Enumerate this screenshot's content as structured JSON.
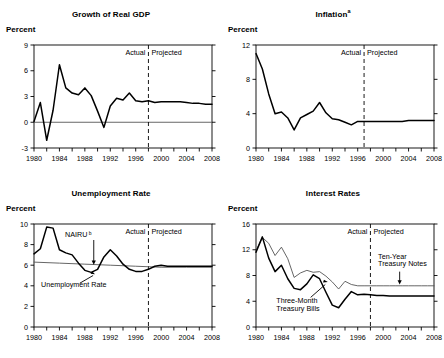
{
  "figure": {
    "panel_title_suffix_note_a": "a",
    "panel_title_suffix_note_b": "b",
    "axis_unit_label": "Percent",
    "actual_label": "Actual",
    "projected_label": "Projected"
  },
  "chart_data": [
    {
      "id": "growth-of-real-gdp",
      "type": "line",
      "title": "Growth of Real GDP",
      "title_superscript": "",
      "ylabel": "Percent",
      "xlabel": "",
      "ylim": [
        -3,
        9
      ],
      "yticks": [
        -3,
        0,
        3,
        6,
        9
      ],
      "ytick_labels": [
        "-3",
        "0",
        "3",
        "6",
        "9"
      ],
      "xlim": [
        1980,
        2008
      ],
      "xticks": [
        1980,
        1982,
        1984,
        1986,
        1988,
        1990,
        1992,
        1994,
        1996,
        1998,
        2000,
        2002,
        2004,
        2006,
        2008
      ],
      "xtick_labels": [
        "1980",
        "",
        "1984",
        "",
        "1988",
        "",
        "1992",
        "",
        "1996",
        "",
        "2000",
        "",
        "2004",
        "",
        "2008"
      ],
      "zero_line": 0,
      "divider_x": 1998,
      "divider_labels": {
        "left": "Actual",
        "right": "Projected"
      },
      "grid": false,
      "legend": "none",
      "series": [
        {
          "name": "Growth of Real GDP",
          "style": "thick",
          "x": [
            1980,
            1981,
            1982,
            1983,
            1984,
            1985,
            1986,
            1987,
            1988,
            1989,
            1990,
            1991,
            1992,
            1993,
            1994,
            1995,
            1996,
            1997,
            1998,
            1999,
            2000,
            2001,
            2002,
            2003,
            2004,
            2005,
            2006,
            2007,
            2008
          ],
          "values": [
            0.1,
            2.3,
            -2.1,
            1.4,
            6.7,
            4.0,
            3.4,
            3.2,
            4.0,
            3.1,
            1.3,
            -0.6,
            1.9,
            2.8,
            2.6,
            3.4,
            2.5,
            2.4,
            2.5,
            2.3,
            2.4,
            2.4,
            2.4,
            2.4,
            2.3,
            2.2,
            2.2,
            2.1,
            2.1
          ]
        }
      ],
      "annotations": []
    },
    {
      "id": "inflation",
      "type": "line",
      "title": "Inflation",
      "title_superscript": "a",
      "ylabel": "Percent",
      "xlabel": "",
      "ylim": [
        0,
        12
      ],
      "yticks": [
        0,
        4,
        8,
        12
      ],
      "ytick_labels": [
        "0",
        "4",
        "8",
        "12"
      ],
      "xlim": [
        1980,
        2008
      ],
      "xticks": [
        1980,
        1982,
        1984,
        1986,
        1988,
        1990,
        1992,
        1994,
        1996,
        1998,
        2000,
        2002,
        2004,
        2006,
        2008
      ],
      "xtick_labels": [
        "1980",
        "",
        "1984",
        "",
        "1988",
        "",
        "1992",
        "",
        "1996",
        "",
        "2000",
        "",
        "2004",
        "",
        "2008"
      ],
      "zero_line": null,
      "divider_x": 1997,
      "divider_labels": {
        "left": "Actual",
        "right": "Projected"
      },
      "grid": false,
      "legend": "none",
      "series": [
        {
          "name": "Inflation",
          "style": "thick",
          "x": [
            1980,
            1981,
            1982,
            1983,
            1984,
            1985,
            1986,
            1987,
            1988,
            1989,
            1990,
            1991,
            1992,
            1993,
            1994,
            1995,
            1996,
            1997,
            1998,
            1999,
            2000,
            2001,
            2002,
            2003,
            2004,
            2005,
            2006,
            2007,
            2008
          ],
          "values": [
            11.0,
            9.2,
            6.3,
            4.0,
            4.2,
            3.5,
            2.1,
            3.5,
            3.9,
            4.3,
            5.3,
            4.1,
            3.4,
            3.3,
            3.0,
            2.7,
            3.1,
            3.1,
            3.1,
            3.1,
            3.1,
            3.1,
            3.1,
            3.1,
            3.2,
            3.2,
            3.2,
            3.2,
            3.2
          ]
        }
      ],
      "annotations": []
    },
    {
      "id": "unemployment-rate",
      "type": "line",
      "title": "Unemployment Rate",
      "title_superscript": "",
      "ylabel": "Percent",
      "xlabel": "",
      "ylim": [
        0,
        10
      ],
      "yticks": [
        0,
        2,
        4,
        6,
        8,
        10
      ],
      "ytick_labels": [
        "0",
        "2",
        "4",
        "6",
        "8",
        "10"
      ],
      "xlim": [
        1980,
        2008
      ],
      "xticks": [
        1980,
        1982,
        1984,
        1986,
        1988,
        1990,
        1992,
        1994,
        1996,
        1998,
        2000,
        2002,
        2004,
        2006,
        2008
      ],
      "xtick_labels": [
        "1980",
        "",
        "1984",
        "",
        "1988",
        "",
        "1992",
        "",
        "1996",
        "",
        "2000",
        "",
        "2004",
        "",
        "2008"
      ],
      "zero_line": null,
      "divider_x": 1998,
      "divider_labels": {
        "left": "Actual",
        "right": "Projected"
      },
      "grid": false,
      "legend": "none",
      "series": [
        {
          "name": "Unemployment Rate",
          "style": "thick",
          "x": [
            1980,
            1981,
            1982,
            1983,
            1984,
            1985,
            1986,
            1987,
            1988,
            1989,
            1990,
            1991,
            1992,
            1993,
            1994,
            1995,
            1996,
            1997,
            1998,
            1999,
            2000,
            2001,
            2002,
            2003,
            2004,
            2005,
            2006,
            2007,
            2008
          ],
          "values": [
            7.1,
            7.6,
            9.7,
            9.6,
            7.5,
            7.2,
            7.0,
            6.2,
            5.5,
            5.3,
            5.6,
            6.8,
            7.5,
            6.9,
            6.1,
            5.6,
            5.4,
            5.4,
            5.6,
            5.9,
            6.0,
            5.9,
            5.9,
            5.9,
            5.9,
            5.9,
            5.9,
            5.9,
            5.9
          ]
        },
        {
          "name": "NAIRU",
          "style": "thin",
          "x": [
            1980,
            1984,
            1988,
            1992,
            1996,
            2000,
            2004,
            2008
          ],
          "values": [
            6.3,
            6.2,
            6.1,
            6.0,
            5.9,
            5.8,
            5.8,
            5.8
          ]
        }
      ],
      "annotations": [
        {
          "id": "nairu-annotation",
          "text": "NAIRU",
          "superscript": "b"
        },
        {
          "id": "unemployment-rate-annotation",
          "text": "Unemployment Rate",
          "superscript": ""
        }
      ]
    },
    {
      "id": "interest-rates",
      "type": "line",
      "title": "Interest Rates",
      "title_superscript": "",
      "ylabel": "Percent",
      "xlabel": "",
      "ylim": [
        0,
        16
      ],
      "yticks": [
        0,
        4,
        8,
        12,
        16
      ],
      "ytick_labels": [
        "0",
        "4",
        "8",
        "12",
        "16"
      ],
      "xlim": [
        1980,
        2008
      ],
      "xticks": [
        1980,
        1982,
        1984,
        1986,
        1988,
        1990,
        1992,
        1994,
        1996,
        1998,
        2000,
        2002,
        2004,
        2006,
        2008
      ],
      "xtick_labels": [
        "1980",
        "",
        "1984",
        "",
        "1988",
        "",
        "1992",
        "",
        "1996",
        "",
        "2000",
        "",
        "2004",
        "",
        "2008"
      ],
      "zero_line": null,
      "divider_x": 1998,
      "divider_labels": {
        "left": "Actual",
        "right": "Projected"
      },
      "grid": false,
      "legend": "none",
      "series": [
        {
          "name": "Three-Month Treasury Bills",
          "style": "thick",
          "x": [
            1980,
            1981,
            1982,
            1983,
            1984,
            1985,
            1986,
            1987,
            1988,
            1989,
            1990,
            1991,
            1992,
            1993,
            1994,
            1995,
            1996,
            1997,
            1998,
            1999,
            2000,
            2001,
            2002,
            2003,
            2004,
            2005,
            2006,
            2007,
            2008
          ],
          "values": [
            11.6,
            14.0,
            10.7,
            8.6,
            9.6,
            7.5,
            6.0,
            5.8,
            6.7,
            8.1,
            7.5,
            5.4,
            3.4,
            3.0,
            4.3,
            5.5,
            5.0,
            5.1,
            5.0,
            4.9,
            4.9,
            4.8,
            4.8,
            4.8,
            4.8,
            4.8,
            4.8,
            4.8,
            4.8
          ]
        },
        {
          "name": "Ten-Year Treasury Notes",
          "style": "thin",
          "x": [
            1980,
            1981,
            1982,
            1983,
            1984,
            1985,
            1986,
            1987,
            1988,
            1989,
            1990,
            1991,
            1992,
            1993,
            1994,
            1995,
            1996,
            1997,
            1998,
            1999,
            2000,
            2001,
            2002,
            2003,
            2004,
            2005,
            2006,
            2007,
            2008
          ],
          "values": [
            11.9,
            13.9,
            13.0,
            11.1,
            12.4,
            10.6,
            7.7,
            8.4,
            8.8,
            8.5,
            8.6,
            7.9,
            7.0,
            5.9,
            7.1,
            6.6,
            6.4,
            6.4,
            6.4,
            6.4,
            6.4,
            6.4,
            6.4,
            6.4,
            6.4,
            6.4,
            6.4,
            6.4,
            6.4
          ]
        }
      ],
      "annotations": [
        {
          "id": "three-month-annotation",
          "text_line1": "Three-Month",
          "text_line2": "Treasury Bills"
        },
        {
          "id": "ten-year-annotation",
          "text_line1": "Ten-Year",
          "text_line2": "Treasury Notes"
        }
      ]
    }
  ]
}
